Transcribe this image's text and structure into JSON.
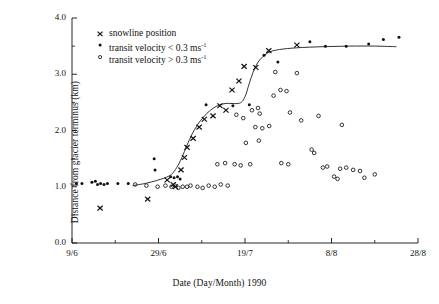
{
  "chart_data": {
    "type": "scatter",
    "title": "",
    "xlabel": "Date (Day/Month) 1990",
    "ylabel": "Distance from glacier terminus (km)",
    "xlim": [
      0,
      80
    ],
    "ylim": [
      0.0,
      4.0
    ],
    "grid": false,
    "legend_position": "top-left-inside",
    "x_tick_labels": [
      "9/6",
      "29/6",
      "19/7",
      "8/8",
      "28/8"
    ],
    "x_tick_values": [
      0,
      20,
      40,
      60,
      80
    ],
    "x_minor_tick_values": [
      10,
      30,
      50,
      70
    ],
    "y_tick_labels": [
      "0.0",
      "1.0",
      "2.0",
      "3.0",
      "4.0"
    ],
    "y_tick_values": [
      0.0,
      1.0,
      2.0,
      3.0,
      4.0
    ],
    "y_minor_tick_values": [
      0.5,
      1.5,
      2.5,
      3.5
    ],
    "x_axis_note": "x is days since 9 June 1990",
    "series": [
      {
        "name": "snowline position",
        "marker": "cross",
        "legend_label": "snowline position",
        "points": [
          [
            6.5,
            0.62
          ],
          [
            17.5,
            0.78
          ],
          [
            22.0,
            1.12
          ],
          [
            23.4,
            1.04
          ],
          [
            23.9,
            1.0
          ],
          [
            25.2,
            1.3
          ],
          [
            26.0,
            1.52
          ],
          [
            26.6,
            1.7
          ],
          [
            28.0,
            1.86
          ],
          [
            29.4,
            2.06
          ],
          [
            30.6,
            2.2
          ],
          [
            32.6,
            2.26
          ],
          [
            34.2,
            2.44
          ],
          [
            35.6,
            2.36
          ],
          [
            37.0,
            2.72
          ],
          [
            38.6,
            2.88
          ],
          [
            39.8,
            3.14
          ],
          [
            42.5,
            3.12
          ],
          [
            45.5,
            3.42
          ],
          [
            52.0,
            3.52
          ]
        ]
      },
      {
        "name": "transit velocity < 0.3 ms-1",
        "marker": "filled-dot",
        "legend_label": "transit velocity < 0.3 ms",
        "legend_sup": "-1",
        "points": [
          [
            1.0,
            1.06
          ],
          [
            2.3,
            1.06
          ],
          [
            4.6,
            1.08
          ],
          [
            5.4,
            1.1
          ],
          [
            5.9,
            1.04
          ],
          [
            6.6,
            1.06
          ],
          [
            7.4,
            1.04
          ],
          [
            8.2,
            1.06
          ],
          [
            10.6,
            1.06
          ],
          [
            13.0,
            1.06
          ],
          [
            19.0,
            1.5
          ],
          [
            19.2,
            1.3
          ],
          [
            22.8,
            1.18
          ],
          [
            23.6,
            1.16
          ],
          [
            24.4,
            1.18
          ],
          [
            25.0,
            1.14
          ],
          [
            31.0,
            2.46
          ],
          [
            37.2,
            2.44
          ],
          [
            41.0,
            2.46
          ],
          [
            44.4,
            3.34
          ],
          [
            47.6,
            3.22
          ],
          [
            55.0,
            3.58
          ],
          [
            58.6,
            3.5
          ],
          [
            63.4,
            3.5
          ],
          [
            68.6,
            3.54
          ],
          [
            72.0,
            3.62
          ],
          [
            75.6,
            3.66
          ]
        ]
      },
      {
        "name": "transit velocity > 0.3 ms-1",
        "marker": "open-circle",
        "legend_label": "transit velocity > 0.3 ms",
        "legend_sup": "-1",
        "points": [
          [
            14.6,
            1.04
          ],
          [
            17.2,
            1.02
          ],
          [
            19.8,
            1.0
          ],
          [
            21.6,
            1.02
          ],
          [
            23.0,
            1.0
          ],
          [
            23.8,
            1.02
          ],
          [
            24.6,
            0.98
          ],
          [
            25.6,
            1.0
          ],
          [
            26.6,
            1.0
          ],
          [
            27.4,
            1.02
          ],
          [
            29.0,
            1.0
          ],
          [
            30.2,
            0.98
          ],
          [
            31.6,
            1.02
          ],
          [
            33.0,
            1.0
          ],
          [
            34.4,
            1.04
          ],
          [
            36.0,
            1.02
          ],
          [
            33.6,
            1.4
          ],
          [
            35.4,
            1.42
          ],
          [
            37.6,
            1.4
          ],
          [
            39.0,
            1.38
          ],
          [
            41.2,
            1.4
          ],
          [
            38.0,
            2.28
          ],
          [
            39.6,
            2.22
          ],
          [
            41.6,
            2.36
          ],
          [
            43.0,
            2.4
          ],
          [
            43.4,
            2.3
          ],
          [
            42.4,
            2.06
          ],
          [
            44.0,
            2.04
          ],
          [
            45.6,
            2.08
          ],
          [
            40.2,
            1.78
          ],
          [
            43.2,
            1.82
          ],
          [
            46.6,
            2.62
          ],
          [
            48.2,
            2.72
          ],
          [
            49.6,
            2.7
          ],
          [
            47.0,
            3.04
          ],
          [
            52.0,
            3.02
          ],
          [
            50.4,
            2.32
          ],
          [
            53.0,
            2.18
          ],
          [
            48.4,
            1.42
          ],
          [
            50.0,
            1.4
          ],
          [
            55.4,
            1.66
          ],
          [
            56.0,
            1.6
          ],
          [
            58.0,
            1.34
          ],
          [
            59.0,
            1.36
          ],
          [
            62.0,
            1.32
          ],
          [
            63.4,
            1.34
          ],
          [
            60.6,
            1.18
          ],
          [
            61.4,
            1.14
          ],
          [
            65.0,
            1.3
          ],
          [
            66.6,
            1.28
          ],
          [
            67.6,
            1.16
          ],
          [
            70.0,
            1.22
          ],
          [
            57.0,
            2.26
          ],
          [
            62.4,
            2.1
          ]
        ]
      }
    ],
    "fitted_curve": {
      "name": "snowline retreat fit",
      "style": "solid-thin",
      "points": [
        [
          14.0,
          1.02
        ],
        [
          17.0,
          1.06
        ],
        [
          19.5,
          1.11
        ],
        [
          21.5,
          1.16
        ],
        [
          23.0,
          1.22
        ],
        [
          24.2,
          1.34
        ],
        [
          25.4,
          1.52
        ],
        [
          26.6,
          1.74
        ],
        [
          27.8,
          1.94
        ],
        [
          29.0,
          2.1
        ],
        [
          30.4,
          2.24
        ],
        [
          32.0,
          2.36
        ],
        [
          33.6,
          2.44
        ],
        [
          35.4,
          2.48
        ],
        [
          37.0,
          2.48
        ],
        [
          38.4,
          2.48
        ],
        [
          39.4,
          2.52
        ],
        [
          40.2,
          2.64
        ],
        [
          41.0,
          2.84
        ],
        [
          41.9,
          3.04
        ],
        [
          42.9,
          3.2
        ],
        [
          44.2,
          3.32
        ],
        [
          45.8,
          3.4
        ],
        [
          48.0,
          3.44
        ],
        [
          52.0,
          3.47
        ],
        [
          58.0,
          3.49
        ],
        [
          64.0,
          3.5
        ],
        [
          70.0,
          3.5
        ],
        [
          75.0,
          3.49
        ]
      ]
    }
  }
}
